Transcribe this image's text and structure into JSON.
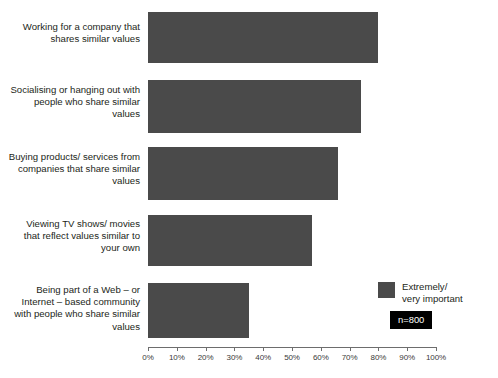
{
  "chart_data": {
    "type": "bar",
    "orientation": "horizontal",
    "title": "",
    "xlabel": "",
    "ylabel": "",
    "xlim": [
      0,
      100
    ],
    "grid": false,
    "categories": [
      "Working for a company\nthat shares similar values",
      "Socialising or hanging\nout with people who\nshare similar values",
      "Buying products/\nservices from companies\nthat share similar values",
      "Viewing TV shows/\nmovies that reflect values\nsimilar to your own",
      "Being part of a Web – or\nInternet – based\ncommunity with people\nwho share similar values"
    ],
    "values": [
      80,
      74,
      66,
      57,
      35
    ],
    "tick_labels": [
      "0%",
      "10%",
      "20%",
      "30%",
      "40%",
      "50%",
      "60%",
      "70%",
      "80%",
      "90%",
      "100%"
    ],
    "tick_values": [
      0,
      10,
      20,
      30,
      40,
      50,
      60,
      70,
      80,
      90,
      100
    ],
    "series": [
      {
        "name": "Extremely/\nvery important",
        "color": "#4a4a4a",
        "values": [
          80,
          74,
          66,
          57,
          35
        ]
      }
    ],
    "legend_position": "bottom-right",
    "annotations": [
      {
        "name": "sample-size",
        "text": "n=800"
      }
    ]
  },
  "legend": {
    "label": "Extremely/\nvery important",
    "swatch_color": "#4a4a4a"
  },
  "badge": {
    "text": "n=800",
    "background": "#000000",
    "text_color": "#ffffff"
  },
  "axis": {
    "color": "#6d6d6d"
  }
}
